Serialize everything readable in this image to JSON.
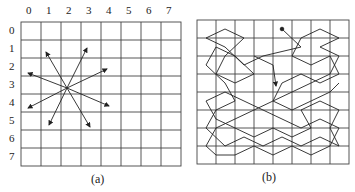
{
  "panel_a": {
    "caption": "(a)",
    "col_labels": [
      "0",
      "1",
      "2",
      "3",
      "4",
      "5",
      "6",
      "7"
    ],
    "row_labels": [
      "0",
      "1",
      "2",
      "3",
      "4",
      "5",
      "6",
      "7"
    ],
    "knight_moves": 8
  },
  "panel_b": {
    "caption": "(b)"
  },
  "colors": {
    "line": "#333333",
    "grid": "#444444"
  }
}
